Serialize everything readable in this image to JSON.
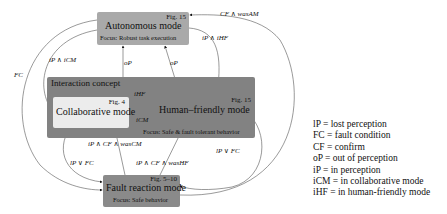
{
  "diagram": {
    "nodes": {
      "autonomous": {
        "title": "Autonomous mode",
        "fig": "Fig. 15",
        "focus": "Focus: Robust task execution"
      },
      "concept": {
        "title": "Interaction concept"
      },
      "collaborative": {
        "title": "Collaborative mode",
        "fig": "Fig. 4"
      },
      "human_friendly": {
        "title": "Human–friendly mode",
        "fig": "Fig. 15",
        "focus": "Focus: Safe & fault tolerant behavior"
      },
      "fault": {
        "title": "Fault reaction mode",
        "fig": "Fig. 5–10",
        "focus": "Focus: Safe behavior"
      }
    },
    "edge_labels": {
      "cf_was_am": "CF ∧ wasAM",
      "ip_ihf": "iP ∧ iHF",
      "ip_icm": "iP ∧ iCM",
      "fc": "FC",
      "op_left": "oP",
      "op_right": "oP",
      "ihf": "iHF",
      "icm": "iCM",
      "ip_cf_wascm": "iP ∧ CF ∧ wasCM",
      "lp_fc_left": "lP ∨ FC",
      "lp_fc_right": "lP ∨ FC",
      "ip_cf_washf": "iP ∧ CF ∧ wasHF"
    },
    "legend": [
      "lP = lost perception",
      "FC = fault condition",
      "CF = confirm",
      "oP = out of perception",
      "iP = in perception",
      "iCM = in collaborative mode",
      "iHF = in human-friendly mode"
    ]
  }
}
